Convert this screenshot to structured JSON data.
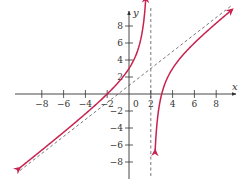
{
  "chart_data": {
    "type": "line",
    "title": "",
    "function": "f(x) = (x^2 - x - 6)/(x - 2) = x + 1 - 4/(x - 2)",
    "xlabel": "x",
    "ylabel": "y",
    "xlim": [
      -10,
      10
    ],
    "ylim": [
      -10,
      10
    ],
    "grid": false,
    "x_ticks": [
      -8,
      -6,
      -4,
      -2,
      0,
      2,
      4,
      6,
      8
    ],
    "x_tick_labels": [
      "−8",
      "−6",
      "−4",
      "−2",
      "0",
      "2",
      "4",
      "6",
      "8"
    ],
    "y_ticks": [
      -8,
      -6,
      -4,
      -2,
      2,
      4,
      6,
      8
    ],
    "y_tick_labels": [
      "−8",
      "−6",
      "−4",
      "−2",
      "2",
      "4",
      "6",
      "8"
    ],
    "series": [
      {
        "name": "f(x) left branch",
        "style": "solid",
        "color": "#c8234f",
        "x_range": [
          -10,
          1.55
        ],
        "key_points": [
          [
            -10,
            -8.67
          ],
          [
            -4,
            -2.33
          ],
          [
            -2,
            0
          ],
          [
            0,
            3
          ],
          [
            1,
            6
          ],
          [
            1.55,
            11.4
          ]
        ]
      },
      {
        "name": "f(x) right branch",
        "style": "solid",
        "color": "#c8234f",
        "x_range": [
          2.4,
          9.5
        ],
        "key_points": [
          [
            2.4,
            -6.6
          ],
          [
            3,
            0
          ],
          [
            4,
            3
          ],
          [
            6,
            6
          ],
          [
            8,
            8.33
          ],
          [
            9.5,
            9.97
          ]
        ]
      },
      {
        "name": "slant asymptote y = x + 1",
        "style": "dashed",
        "color": "#555555",
        "x_range": [
          -10,
          9.5
        ],
        "key_points": [
          [
            -10,
            -9
          ],
          [
            -1,
            0
          ],
          [
            0,
            1
          ],
          [
            2,
            3
          ],
          [
            9.5,
            10.5
          ]
        ]
      },
      {
        "name": "vertical asymptote x = 2",
        "style": "dashed",
        "color": "#555555",
        "x": 2
      }
    ],
    "x_intercepts": [
      -2,
      3
    ],
    "y_intercept": 3,
    "legend": null
  },
  "colors": {
    "curve": "#c8234f",
    "axis": "#333333",
    "asymptote": "#555555"
  },
  "axes": {
    "x_label": "x",
    "y_label": "y"
  }
}
